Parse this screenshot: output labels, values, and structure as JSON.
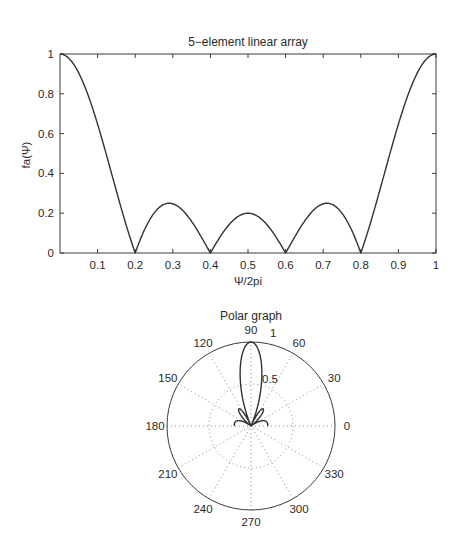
{
  "chart_data": [
    {
      "type": "line",
      "title": "5−element linear array",
      "xlabel": "Ψ/2pi",
      "ylabel": "fa(Ψ)",
      "xlim": [
        0,
        1
      ],
      "ylim": [
        0,
        1
      ],
      "grid": false,
      "xticks": [
        0.1,
        0.2,
        0.3,
        0.4,
        0.5,
        0.6,
        0.7,
        0.8,
        0.9,
        1
      ],
      "xtick_labels": [
        "0.1",
        "0.2",
        "0.3",
        "0.4",
        "0.5",
        "0.6",
        "0.7",
        "0.8",
        "0.9",
        "1"
      ],
      "yticks": [
        0,
        0.2,
        0.4,
        0.6,
        0.8,
        1
      ],
      "ytick_labels": [
        "0",
        "0.2",
        "0.4",
        "0.6",
        "0.8",
        "1"
      ],
      "formula": "|sin(5*pi*u) / (5*sin(pi*u))|",
      "series": [
        {
          "name": "fa",
          "x": [
            0,
            0.05,
            0.1,
            0.15,
            0.2,
            0.25,
            0.3,
            0.35,
            0.4,
            0.45,
            0.5,
            0.55,
            0.6,
            0.65,
            0.7,
            0.75,
            0.8,
            0.85,
            0.9,
            0.95,
            1
          ],
          "y": [
            1,
            0.836,
            0.401,
            0.104,
            0,
            0.155,
            0.247,
            0.174,
            0,
            0.143,
            0.2,
            0.143,
            0,
            0.174,
            0.247,
            0.155,
            0,
            0.104,
            0.401,
            0.836,
            1
          ]
        }
      ],
      "annotations": {
        "nulls": [
          0.2,
          0.4,
          0.6,
          0.8
        ],
        "sidelobe_peaks": [
          {
            "x": 0.3,
            "y": 0.25
          },
          {
            "x": 0.5,
            "y": 0.2
          },
          {
            "x": 0.7,
            "y": 0.25
          }
        ]
      }
    },
    {
      "type": "polar",
      "title": "Polar graph",
      "rlim": [
        0,
        1
      ],
      "r_ticks": [
        0.5,
        1
      ],
      "r_tick_labels": [
        "0.5",
        "1"
      ],
      "theta_ticks": [
        0,
        30,
        60,
        90,
        120,
        150,
        180,
        210,
        240,
        270,
        300,
        330
      ],
      "theta_tick_labels": [
        "0",
        "30",
        "60",
        "90",
        "120",
        "150",
        "180",
        "210",
        "240",
        "270",
        "300",
        "330"
      ],
      "grid": "dotted",
      "theta_range_deg": [
        0,
        180
      ],
      "formula": "r = |sin(5*psi/2) / (5*sin(psi/2))|, psi = pi*cos(theta)",
      "main_lobe_direction_deg": 90,
      "main_lobe_peak": 1
    }
  ],
  "linear": {
    "title": "5−element linear array",
    "xlabel": "Ψ/2pi",
    "ylabel": "fa(Ψ)"
  },
  "polar": {
    "title": "Polar graph",
    "label_05": "0.5",
    "label_1": "1"
  }
}
